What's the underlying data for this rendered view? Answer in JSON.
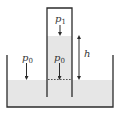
{
  "diagram": {
    "type": "physics-schematic",
    "labels": {
      "tube_gas_pressure": "p1",
      "tube_gas_pressure_main": "p",
      "tube_gas_pressure_sub": "1",
      "inner_level_pressure_main": "p",
      "inner_level_pressure_sub": "0",
      "outer_surface_pressure_main": "p",
      "outer_surface_pressure_sub": "0",
      "height_difference": "h"
    },
    "colors": {
      "liquid": "#e6e6e6",
      "stroke": "#2b2b2b",
      "text": "#333333",
      "background": "#ffffff"
    }
  }
}
